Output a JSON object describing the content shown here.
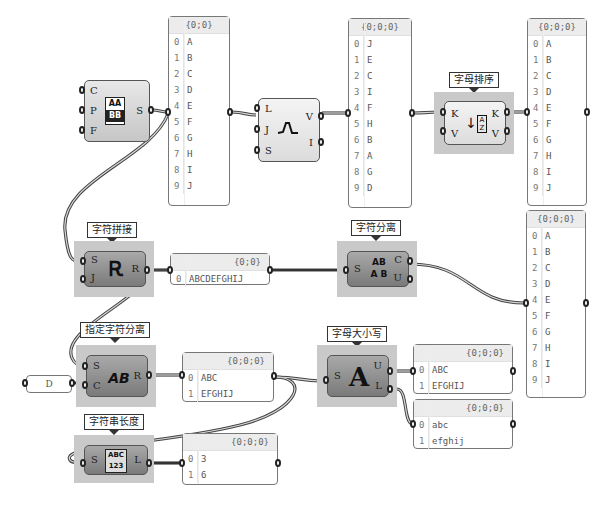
{
  "canvas": {
    "components": {
      "format": {
        "inputs": [
          "C",
          "P",
          "F"
        ],
        "outputs": [
          "S"
        ],
        "icon": "format-icon",
        "icon_text_top": "AA",
        "icon_text_bottom": "BB"
      },
      "jitter": {
        "inputs": [
          "L",
          "J",
          "S"
        ],
        "outputs": [
          "V",
          "I"
        ],
        "icon": "jitter-icon"
      },
      "sort": {
        "tag": "字母排序",
        "inputs": [
          "K",
          "V"
        ],
        "outputs": [
          "K",
          "V"
        ],
        "icon": "sort-az-icon",
        "icon_text": "AZ"
      },
      "concat": {
        "tag": "字符拼接",
        "inputs": [
          "S",
          "J"
        ],
        "outputs": [
          "R"
        ],
        "icon": "concatenate-icon"
      },
      "characters": {
        "tag": "字符分离",
        "inputs": [
          "S"
        ],
        "outputs": [
          "C",
          "U"
        ],
        "icon": "characters-icon",
        "icon_text_top": "AB",
        "icon_text_bottom": "A B"
      },
      "split": {
        "tag": "指定字符分离",
        "inputs": [
          "S",
          "C"
        ],
        "outputs": [
          "R"
        ],
        "icon": "split-text-icon",
        "icon_text": "AB"
      },
      "case": {
        "tag": "字母大小写",
        "inputs": [
          "S"
        ],
        "outputs": [
          "U",
          "L"
        ],
        "icon": "text-case-icon",
        "icon_text": "A"
      },
      "length": {
        "tag": "字符串长度",
        "inputs": [
          "S"
        ],
        "outputs": [
          "L"
        ],
        "icon": "text-length-icon",
        "icon_text_top": "ABC",
        "icon_text_bottom": "123"
      }
    },
    "panels": {
      "source": {
        "header": "{0;0}",
        "rows": [
          [
            "0",
            "A"
          ],
          [
            "1",
            "B"
          ],
          [
            "2",
            "C"
          ],
          [
            "3",
            "D"
          ],
          [
            "4",
            "E"
          ],
          [
            "5",
            "F"
          ],
          [
            "6",
            "G"
          ],
          [
            "7",
            "H"
          ],
          [
            "8",
            "I"
          ],
          [
            "9",
            "J"
          ]
        ]
      },
      "jittered": {
        "header": "{0;0;0}",
        "rows": [
          [
            "0",
            "J"
          ],
          [
            "1",
            "E"
          ],
          [
            "2",
            "C"
          ],
          [
            "3",
            "I"
          ],
          [
            "4",
            "F"
          ],
          [
            "5",
            "H"
          ],
          [
            "6",
            "B"
          ],
          [
            "7",
            "A"
          ],
          [
            "8",
            "G"
          ],
          [
            "9",
            "D"
          ]
        ]
      },
      "sorted": {
        "header": "{0;0;0}",
        "rows": [
          [
            "0",
            "A"
          ],
          [
            "1",
            "B"
          ],
          [
            "2",
            "C"
          ],
          [
            "3",
            "D"
          ],
          [
            "4",
            "E"
          ],
          [
            "5",
            "F"
          ],
          [
            "6",
            "G"
          ],
          [
            "7",
            "H"
          ],
          [
            "8",
            "I"
          ],
          [
            "9",
            "J"
          ]
        ]
      },
      "chars": {
        "header": "{0;0;0}",
        "rows": [
          [
            "0",
            "A"
          ],
          [
            "1",
            "B"
          ],
          [
            "2",
            "C"
          ],
          [
            "3",
            "D"
          ],
          [
            "4",
            "E"
          ],
          [
            "5",
            "F"
          ],
          [
            "6",
            "G"
          ],
          [
            "7",
            "H"
          ],
          [
            "8",
            "I"
          ],
          [
            "9",
            "J"
          ]
        ]
      },
      "joined": {
        "header": "{0;0}",
        "rows": [
          [
            "0",
            "ABCDEFGHIJ"
          ]
        ]
      },
      "split_result": {
        "header": "{0;0;0}",
        "rows": [
          [
            "0",
            "ABC"
          ],
          [
            "1",
            "EFGHIJ"
          ]
        ]
      },
      "upper": {
        "header": "{0;0;0}",
        "rows": [
          [
            "0",
            "ABC"
          ],
          [
            "1",
            "EFGHIJ"
          ]
        ]
      },
      "lower": {
        "header": "{0;0;0}",
        "rows": [
          [
            "0",
            "abc"
          ],
          [
            "1",
            "efghij"
          ]
        ]
      },
      "lengths": {
        "header": "{0;0;0}",
        "rows": [
          [
            "0",
            "3"
          ],
          [
            "1",
            "6"
          ]
        ]
      },
      "separator": {
        "value": "D"
      }
    }
  }
}
